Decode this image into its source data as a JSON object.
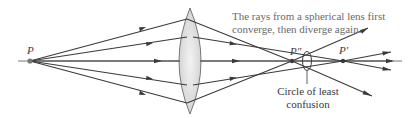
{
  "diagram": {
    "caption_line1": "The rays from a spherical lens first",
    "caption_line2": "converge, then diverge again.",
    "labels": {
      "source_point": "P",
      "near_focus": "P″",
      "far_focus": "P′",
      "circle_line1": "Circle of least",
      "circle_line2": "confusion"
    },
    "colors": {
      "ray": "#3a3a3a",
      "lens_fill": "#e4e4e4",
      "lens_stroke": "#6a6a6a",
      "caption_text": "#6a6a6a",
      "label_text": "#3a3a3a"
    },
    "elements": [
      "optical-axis",
      "converging-lens",
      "source-point-P",
      "paraxial-focus-P-prime",
      "marginal-focus-P-double-prime",
      "circle-of-least-confusion",
      "rays-x5"
    ]
  }
}
